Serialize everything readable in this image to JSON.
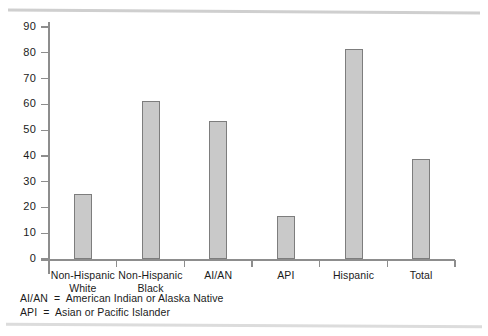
{
  "chart_data": {
    "type": "bar",
    "title": "",
    "subtitle": "",
    "xlabel": "",
    "ylabel": "",
    "ylim": [
      0,
      90
    ],
    "ytick_step": 10,
    "yticks": [
      "90",
      "80",
      "70",
      "60",
      "50",
      "40",
      "30",
      "20",
      "10",
      "0"
    ],
    "grid": false,
    "legend": "none",
    "categories": [
      "Non-Hispanic\nWhite",
      "Non-Hispanic\nBlack",
      "AI/AN",
      "API",
      "Hispanic",
      "Total"
    ],
    "category_lines": [
      [
        "Non-Hispanic",
        "White"
      ],
      [
        "Non-Hispanic",
        "Black"
      ],
      [
        "AI/AN",
        ""
      ],
      [
        "API",
        ""
      ],
      [
        "Hispanic",
        ""
      ],
      [
        "Total",
        ""
      ]
    ],
    "values": [
      25.2,
      61.3,
      53.4,
      16.8,
      81.6,
      38.7
    ],
    "bar_fill": "#c9c9c9",
    "bar_stroke": "#7d7d7d",
    "axis_color": "#8d8d8d"
  },
  "footnotes": [
    "AI/AN  =  American Indian or Alaska Native",
    "API  =  Asian or Pacific Islander"
  ]
}
